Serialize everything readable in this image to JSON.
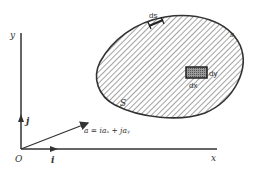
{
  "figure": {
    "axes": {
      "x_label": "x",
      "y_label": "y",
      "origin_label": "O",
      "unit_x_label": "i",
      "unit_y_label": "j"
    },
    "vector": {
      "label": "a = iaₓ + jaᵧ"
    },
    "region": {
      "area_label": "S",
      "boundary_label": "s",
      "arc_element_label": "ds",
      "area_element_dx_label": "dx",
      "area_element_dy_label": "dy"
    },
    "colors": {
      "ink": "#333333",
      "background": "#ffffff",
      "hatch": "#555555",
      "element_fill": "#777777"
    }
  }
}
